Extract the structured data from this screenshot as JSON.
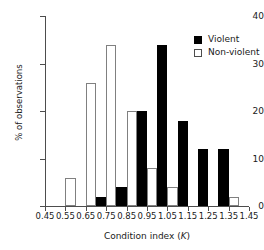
{
  "chart_data": {
    "type": "bar",
    "title": "",
    "xlabel": "Condition index (K)",
    "xlabel_plain": "Condition index",
    "xlabel_symbol": "K",
    "ylabel": "% of observations",
    "xlim": [
      0.45,
      1.45
    ],
    "ylim": [
      0,
      40
    ],
    "grid": false,
    "bin_width": 0.1,
    "legend_position": "top-right",
    "xticks": [
      "0.45",
      "0.55",
      "0.65",
      "0.75",
      "0.85",
      "0.95",
      "1.05",
      "1.15",
      "1.25",
      "1.35",
      "1.45"
    ],
    "xtick_values": [
      0.45,
      0.55,
      0.65,
      0.75,
      0.85,
      0.95,
      1.05,
      1.15,
      1.25,
      1.35,
      1.45
    ],
    "yticks": [
      "0",
      "10",
      "20",
      "30",
      "40"
    ],
    "ytick_values": [
      0,
      10,
      20,
      30,
      40
    ],
    "categories": [
      "0.45-0.55",
      "0.55-0.65",
      "0.65-0.75",
      "0.75-0.85",
      "0.85-0.95",
      "0.95-1.05",
      "1.05-1.15",
      "1.15-1.25",
      "1.25-1.35",
      "1.35-1.45"
    ],
    "bin_starts": [
      0.45,
      0.55,
      0.65,
      0.75,
      0.85,
      0.95,
      1.05,
      1.15,
      1.25,
      1.35
    ],
    "series": [
      {
        "name": "Non-violent",
        "color": "#ffffff",
        "edge_color": "#808080",
        "values": [
          0,
          6,
          26,
          34,
          20,
          8,
          4,
          0,
          0,
          2
        ]
      },
      {
        "name": "Violent",
        "color": "#000000",
        "edge_color": "#000000",
        "values": [
          0,
          0,
          2,
          4,
          20,
          34,
          18,
          12,
          12,
          0
        ]
      }
    ],
    "legend": [
      {
        "label": "Violent",
        "swatch": "filled-black-square"
      },
      {
        "label": "Non-violent",
        "swatch": "open-white-square"
      }
    ]
  },
  "colors": {
    "violent": "#000000",
    "nonviolent": "#ffffff",
    "axis": "#4d4d4d",
    "text": "#1a1a1a",
    "background": "#ffffff"
  }
}
